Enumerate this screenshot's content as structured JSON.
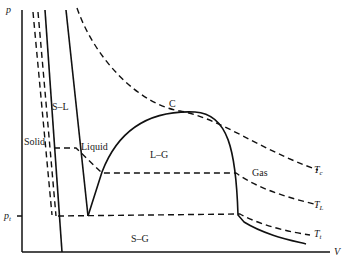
{
  "diagram": {
    "axes": {
      "y_label": "p",
      "x_label": "V",
      "y_tick": "p",
      "y_tick_sub": "t"
    },
    "regions": {
      "solid": "Solid",
      "solid_liquid": "S–L",
      "liquid": "Liquid",
      "liquid_gas": "L–G",
      "gas": "Gas",
      "solid_gas": "S–G"
    },
    "critical_point": "C",
    "isotherms": [
      {
        "symbol": "T",
        "sub": "c"
      },
      {
        "symbol": "T",
        "sub": "L"
      },
      {
        "symbol": "T",
        "sub": "t"
      }
    ]
  }
}
